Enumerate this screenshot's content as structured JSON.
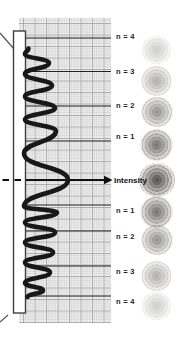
{
  "figure": {
    "description_labels": {
      "intensity": "Intensity"
    },
    "order_labels": [
      {
        "text": "n = 4",
        "y": 37,
        "side": "top"
      },
      {
        "text": "n = 3",
        "y": 72,
        "side": "top"
      },
      {
        "text": "n = 2",
        "y": 105.5,
        "side": "top"
      },
      {
        "text": "n = 1",
        "y": 137,
        "side": "top"
      },
      {
        "text": "n = 1",
        "y": 211,
        "side": "bottom"
      },
      {
        "text": "n = 2",
        "y": 237,
        "side": "bottom"
      },
      {
        "text": "n = 3",
        "y": 272,
        "side": "bottom"
      },
      {
        "text": "n = 4",
        "y": 302,
        "side": "bottom"
      }
    ],
    "order_lines_y": [
      38,
      71.5,
      106,
      141,
      205,
      231,
      266,
      296
    ],
    "arrow": {
      "y": 180,
      "dash_x1": 2.5,
      "dash_x2": 26,
      "solid_x2": 105,
      "tip_x": 112.5
    },
    "spots": [
      {
        "y": 50,
        "size": 29,
        "opacity": 0.28
      },
      {
        "y": 81,
        "size": 31,
        "opacity": 0.45
      },
      {
        "y": 112,
        "size": 32,
        "opacity": 0.62
      },
      {
        "y": 145,
        "size": 33,
        "opacity": 0.8
      },
      {
        "y": 180,
        "size": 36,
        "opacity": 1.0
      },
      {
        "y": 212,
        "size": 33,
        "opacity": 0.8
      },
      {
        "y": 240,
        "size": 32,
        "opacity": 0.62
      },
      {
        "y": 276,
        "size": 31,
        "opacity": 0.45
      },
      {
        "y": 306,
        "size": 29,
        "opacity": 0.28
      }
    ],
    "spots_center_x": 156.5,
    "waveform_points": [
      [
        28.5,
        48.5
      ],
      [
        25,
        54
      ],
      [
        49,
        63
      ],
      [
        25,
        74
      ],
      [
        52,
        85.5
      ],
      [
        25,
        96.5
      ],
      [
        55,
        108
      ],
      [
        25,
        119.5
      ],
      [
        56,
        131
      ],
      [
        24,
        153.5
      ],
      [
        68,
        180
      ],
      [
        24,
        206.5
      ],
      [
        57,
        212.5
      ],
      [
        25,
        222.5
      ],
      [
        55,
        232.5
      ],
      [
        25,
        242.5
      ],
      [
        53,
        252.5
      ],
      [
        25,
        262.5
      ],
      [
        50,
        272.5
      ],
      [
        25,
        283
      ],
      [
        43,
        290.5
      ],
      [
        27.5,
        297
      ]
    ],
    "colors": {
      "background": "#ffffff",
      "grid_minor": "#c9c9c9",
      "grid_major": "#9a9a9a",
      "grid_bg": "#f5f5f5",
      "plate_fill": "#ffffff",
      "plate_stroke": "#3f3f3f",
      "wave": "#181818",
      "order_line": "#222222",
      "arrow": "#111111",
      "label_text": "#1c1c1c"
    }
  }
}
